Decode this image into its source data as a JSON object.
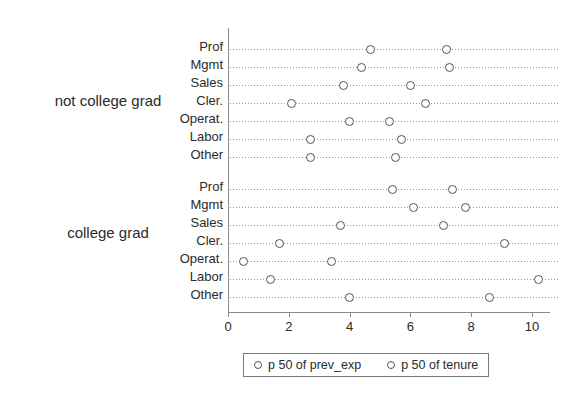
{
  "chart_data": {
    "type": "scatter",
    "title": "",
    "xlabel": "",
    "ylabel": "",
    "xlim": [
      0,
      10.8
    ],
    "xticks": [
      0,
      2,
      4,
      6,
      8,
      10
    ],
    "grid": true,
    "legend_position": "bottom",
    "legend": [
      {
        "label": "p 50 of prev_exp",
        "marker": "open-circle"
      },
      {
        "label": "p 50 of tenure",
        "marker": "open-circle"
      }
    ],
    "series": [
      {
        "name": "p 50 of prev_exp"
      },
      {
        "name": "p 50 of tenure"
      }
    ],
    "groups": [
      {
        "label": "not college grad",
        "categories": [
          "Prof",
          "Mgmt",
          "Sales",
          "Cler.",
          "Operat.",
          "Labor",
          "Other"
        ],
        "prev_exp": [
          4.7,
          4.4,
          3.8,
          2.1,
          4.0,
          2.7,
          2.7
        ],
        "tenure": [
          7.2,
          7.3,
          6.0,
          6.5,
          5.3,
          5.7,
          5.5
        ]
      },
      {
        "label": "college grad",
        "categories": [
          "Prof",
          "Mgmt",
          "Sales",
          "Cler.",
          "Operat.",
          "Labor",
          "Other"
        ],
        "prev_exp": [
          5.4,
          6.1,
          3.7,
          1.7,
          0.5,
          1.4,
          4.0
        ],
        "tenure": [
          7.4,
          7.8,
          7.1,
          9.1,
          3.4,
          10.2,
          8.6
        ]
      }
    ]
  },
  "axis": {
    "tick_labels": [
      "0",
      "2",
      "4",
      "6",
      "8",
      "10"
    ]
  },
  "colors": {
    "marker_stroke": "#555555",
    "grid": "#9a9a9a",
    "axis": "#8a8a8a",
    "text": "#2b2b2b"
  }
}
